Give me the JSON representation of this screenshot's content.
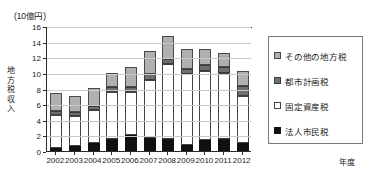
{
  "chart_data": {
    "type": "bar",
    "stacked": true,
    "title": "",
    "unit_caption": "(10億円)",
    "ylabel": "地方税収入",
    "xlabel": "年度",
    "ylim": [
      0,
      16
    ],
    "yticks": [
      0,
      2,
      4,
      6,
      8,
      10,
      12,
      14,
      16
    ],
    "grid": true,
    "legend_position": "right",
    "categories": [
      "2002",
      "2003",
      "2004",
      "2005",
      "2006",
      "2007",
      "2008",
      "2009",
      "2010",
      "2011",
      "2012"
    ],
    "series": [
      {
        "name": "法人市民税",
        "swatch": "s0",
        "color": "#111111",
        "values": [
          0.4,
          0.6,
          1.0,
          1.6,
          2.0,
          1.7,
          1.5,
          0.8,
          1.4,
          1.6,
          1.0
        ]
      },
      {
        "name": "固定資産税",
        "swatch": "s1",
        "color": "#ffffff",
        "values": [
          4.2,
          3.9,
          4.3,
          6.0,
          5.6,
          7.4,
          9.7,
          9.1,
          8.9,
          8.4,
          6.0
        ]
      },
      {
        "name": "都市計画税",
        "swatch": "s2",
        "color": "#6f6f6f",
        "values": [
          0.5,
          0.5,
          0.5,
          0.6,
          0.6,
          0.7,
          0.6,
          0.6,
          0.7,
          0.7,
          1.3
        ]
      },
      {
        "name": "その他の地方税",
        "swatch": "s3",
        "color": "#b0b0b0",
        "values": [
          2.3,
          2.1,
          2.3,
          1.8,
          2.6,
          3.0,
          2.9,
          2.5,
          2.0,
          1.9,
          2.0
        ]
      }
    ],
    "totals": [
      7.4,
      7.1,
      8.1,
      10.0,
      10.8,
      12.8,
      14.7,
      13.0,
      13.0,
      12.6,
      10.3
    ]
  }
}
